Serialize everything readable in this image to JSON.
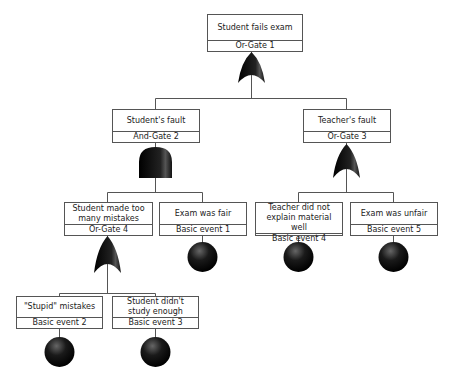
{
  "diagram": {
    "type": "fault-tree",
    "nodes": [
      {
        "id": "top",
        "title": "Student fails exam",
        "sub": "Or-Gate 1",
        "symbol": "or-gate"
      },
      {
        "id": "n2",
        "title": "Student's fault",
        "sub": "And-Gate 2",
        "symbol": "and-gate"
      },
      {
        "id": "n3",
        "title": "Teacher's fault",
        "sub": "Or-Gate 3",
        "symbol": "or-gate"
      },
      {
        "id": "n4",
        "title": "Student made too many mistakes",
        "sub": "Or-Gate 4",
        "symbol": "or-gate"
      },
      {
        "id": "e1",
        "title": "Exam was fair",
        "sub": "Basic event 1",
        "symbol": "basic-event"
      },
      {
        "id": "e4",
        "title": "Teacher did not explain material well",
        "sub": "Basic event 4",
        "symbol": "basic-event"
      },
      {
        "id": "e5",
        "title": "Exam was unfair",
        "sub": "Basic event 5",
        "symbol": "basic-event"
      },
      {
        "id": "e2",
        "title": "\"Stupid\" mistakes",
        "sub": "Basic event 2",
        "symbol": "basic-event"
      },
      {
        "id": "e3",
        "title": "Student didn't study enough",
        "sub": "Basic event 3",
        "symbol": "basic-event"
      }
    ],
    "edges": [
      [
        "top",
        "n2"
      ],
      [
        "top",
        "n3"
      ],
      [
        "n2",
        "n4"
      ],
      [
        "n2",
        "e1"
      ],
      [
        "n3",
        "e4"
      ],
      [
        "n3",
        "e5"
      ],
      [
        "n4",
        "e2"
      ],
      [
        "n4",
        "e3"
      ]
    ],
    "colors": {
      "line": "#555555",
      "symbol": "#111111"
    }
  }
}
